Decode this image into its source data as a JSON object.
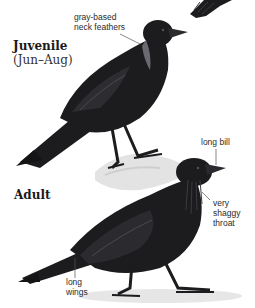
{
  "figures": [
    {
      "id": "juvenile",
      "heading": {
        "title": "Juvenile",
        "subtitle": "(Jun–Aug)"
      },
      "callouts": [
        {
          "label": "gray-based\nneck feathers"
        }
      ]
    },
    {
      "id": "adult",
      "heading": {
        "title": "Adult"
      },
      "callouts": [
        {
          "label": "long bill"
        },
        {
          "label": "very\nshaggy\nthroat"
        },
        {
          "label": "long\nwings"
        }
      ]
    }
  ],
  "colors": {
    "plumage": "#1c1c1f",
    "plumage_highlight": "#4a4a50",
    "ground": "#e6e6e6",
    "callout_line": "#555555"
  }
}
